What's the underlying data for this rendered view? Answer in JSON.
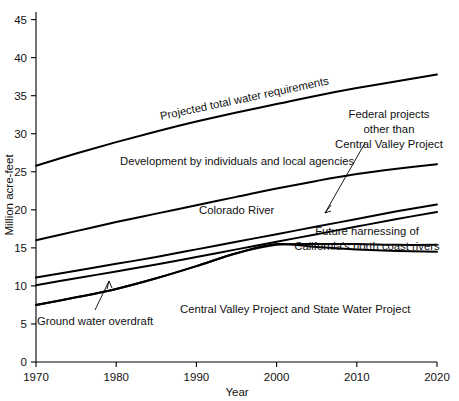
{
  "chart_data": {
    "type": "line",
    "title": "",
    "xlabel": "Year",
    "ylabel": "Million acre-feet",
    "xlim": [
      1970,
      2020
    ],
    "ylim": [
      0,
      46
    ],
    "grid": false,
    "legend_position": "inline-annotations",
    "xticks": [
      1970,
      1980,
      1990,
      2000,
      2010,
      2020
    ],
    "xtick_labels": [
      "1970",
      "1980",
      "1990",
      "2000",
      "2010",
      "2020"
    ],
    "yticks": [
      0,
      5,
      10,
      15,
      20,
      25,
      30,
      35,
      40,
      45
    ],
    "ytick_labels": [
      "0",
      "5",
      "10",
      "15",
      "20",
      "25",
      "30",
      "35",
      "40",
      "45"
    ],
    "x": [
      1970,
      1975,
      1980,
      1985,
      1990,
      1995,
      2000,
      2005,
      2010,
      2015,
      2020
    ],
    "series": [
      {
        "name": "Projected total water requirements",
        "values": [
          25.8,
          27.4,
          28.9,
          30.3,
          31.6,
          32.8,
          33.9,
          35.0,
          36.0,
          36.9,
          37.8
        ]
      },
      {
        "name": "Development by individuals and local agencies",
        "values": [
          16.0,
          17.2,
          18.4,
          19.5,
          20.6,
          21.7,
          22.8,
          23.8,
          24.7,
          25.4,
          26.0
        ]
      },
      {
        "name": "Colorado River",
        "values": [
          11.1,
          12.0,
          12.9,
          13.8,
          14.8,
          15.8,
          16.8,
          17.8,
          18.8,
          19.8,
          20.7
        ]
      },
      {
        "name": "Federal projects other than Central Valley Project",
        "values": [
          10.1,
          11.0,
          11.9,
          12.8,
          13.8,
          14.8,
          15.8,
          16.8,
          17.8,
          18.8,
          19.7
        ]
      },
      {
        "name": "Ground water overdraft",
        "values": [
          7.5,
          8.5,
          9.6,
          11.0,
          12.6,
          14.3,
          15.4,
          15.5,
          15.5,
          15.4,
          15.4
        ]
      },
      {
        "name": "Future harnessing of California's north coast rivers",
        "values": [
          7.5,
          8.5,
          9.6,
          11.0,
          12.6,
          14.3,
          15.5,
          15.1,
          14.8,
          14.6,
          14.5
        ]
      }
    ],
    "annotations": [
      {
        "id": "projected-total-water-requirements",
        "text": "Projected total water requirements",
        "rotation": -12
      },
      {
        "id": "development-by-individuals",
        "text": "Development by individuals and local agencies",
        "rotation": 0
      },
      {
        "id": "colorado-river",
        "text": "Colorado River",
        "rotation": 0
      },
      {
        "id": "federal-projects-line1",
        "text": "Federal projects",
        "rotation": 0
      },
      {
        "id": "federal-projects-line2",
        "text": "other than",
        "rotation": 0
      },
      {
        "id": "federal-projects-line3",
        "text": "Central Valley Project",
        "rotation": 0
      },
      {
        "id": "future-harnessing-line1",
        "text": "Future harnessing of",
        "rotation": 0
      },
      {
        "id": "future-harnessing-line2",
        "text": "California's north coast rivers",
        "rotation": 0
      },
      {
        "id": "ground-water-overdraft",
        "text": "Ground water overdraft",
        "rotation": 0
      },
      {
        "id": "central-valley-state-water",
        "text": "Central Valley Project and State Water Project",
        "rotation": 0
      }
    ],
    "colors": {
      "line": "#000000",
      "axis": "#000000",
      "text": "#111111",
      "background": "#ffffff"
    }
  }
}
